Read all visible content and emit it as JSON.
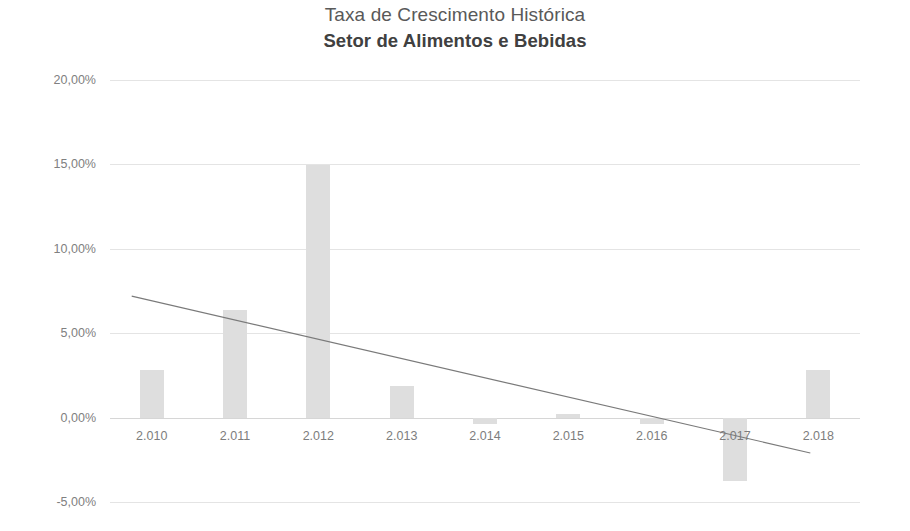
{
  "chart_data": {
    "type": "bar",
    "title": "Taxa de Crescimento Histórica",
    "subtitle": "Setor de Alimentos e Bebidas",
    "xlabel": "",
    "ylabel": "",
    "categories": [
      "2.010",
      "2.011",
      "2.012",
      "2.013",
      "2.014",
      "2.015",
      "2.016",
      "2.017",
      "2.018"
    ],
    "values": [
      2.85,
      6.4,
      14.95,
      1.9,
      -0.4,
      0.2,
      -0.4,
      -3.75,
      2.85
    ],
    "value_unit": "%",
    "ylim": [
      -5.0,
      20.0
    ],
    "ytick_labels": [
      "20,00%",
      "15,00%",
      "10,00%",
      "5,00%",
      "0,00%",
      "-5,00%"
    ],
    "ytick_values": [
      20.0,
      15.0,
      10.0,
      5.0,
      0.0,
      -5.0
    ],
    "grid": true,
    "legend": false,
    "legend_position": "none",
    "bar_color": "#dedede",
    "series": [
      {
        "name": "Taxa de Crescimento",
        "type": "bar",
        "values": [
          2.85,
          6.4,
          14.95,
          1.9,
          -0.4,
          0.2,
          -0.4,
          -3.75,
          2.85
        ]
      },
      {
        "name": "Linha de Tendência",
        "type": "line-trend",
        "color": "#7a7a7a",
        "start_value": 7.2,
        "end_value": -2.1
      }
    ],
    "annotations": []
  },
  "icons": {
    "trendline": "trend-line-icon"
  }
}
